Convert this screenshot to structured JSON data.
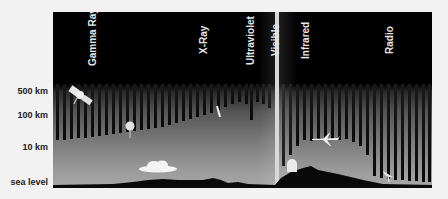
{
  "figure": {
    "bands": [
      {
        "label": "Gamma Ray",
        "x": 93
      },
      {
        "label": "X-Ray",
        "x": 204
      },
      {
        "label": "Ultraviolet",
        "x": 251
      },
      {
        "label": "Visible",
        "x": 276
      },
      {
        "label": "Infrared",
        "x": 306
      },
      {
        "label": "Radio",
        "x": 390
      }
    ],
    "altitudes": [
      {
        "label": "500 km",
        "y": 92
      },
      {
        "label": "100 km",
        "y": 116
      },
      {
        "label": "10 km",
        "y": 148
      },
      {
        "label": "sea level",
        "y": 183
      }
    ],
    "icons": [
      {
        "name": "satellite-icon",
        "x": 72,
        "y": 87
      },
      {
        "name": "rocket-icon",
        "x": 218,
        "y": 106
      },
      {
        "name": "balloon-icon",
        "x": 128,
        "y": 123
      },
      {
        "name": "cloud-icon",
        "x": 139,
        "y": 160
      },
      {
        "name": "airplane-icon",
        "x": 313,
        "y": 135
      },
      {
        "name": "observatory-dome-icon",
        "x": 287,
        "y": 158
      },
      {
        "name": "radio-dish-icon",
        "x": 382,
        "y": 170
      }
    ],
    "colors": {
      "sky_top": "#000000",
      "sky_bottom": "#a8a8a8",
      "ray": "#111111",
      "visible_beam": "#d8d8d8",
      "ground": "#0a0a0a"
    }
  },
  "rays": [
    {
      "x": 57,
      "end": 140
    },
    {
      "x": 64,
      "end": 140
    },
    {
      "x": 71,
      "end": 139
    },
    {
      "x": 78,
      "end": 138
    },
    {
      "x": 85,
      "end": 138
    },
    {
      "x": 92,
      "end": 137
    },
    {
      "x": 99,
      "end": 136
    },
    {
      "x": 106,
      "end": 135
    },
    {
      "x": 113,
      "end": 134
    },
    {
      "x": 120,
      "end": 133
    },
    {
      "x": 127,
      "end": 132
    },
    {
      "x": 134,
      "end": 131
    },
    {
      "x": 141,
      "end": 130
    },
    {
      "x": 148,
      "end": 129
    },
    {
      "x": 155,
      "end": 128
    },
    {
      "x": 162,
      "end": 127
    },
    {
      "x": 169,
      "end": 125
    },
    {
      "x": 176,
      "end": 123
    },
    {
      "x": 183,
      "end": 121
    },
    {
      "x": 190,
      "end": 119
    },
    {
      "x": 197,
      "end": 117
    },
    {
      "x": 204,
      "end": 115
    },
    {
      "x": 211,
      "end": 113
    },
    {
      "x": 218,
      "end": 110
    },
    {
      "x": 225,
      "end": 107
    },
    {
      "x": 232,
      "end": 104
    },
    {
      "x": 239,
      "end": 102
    },
    {
      "x": 246,
      "end": 104
    },
    {
      "x": 251,
      "end": 120
    },
    {
      "x": 257,
      "end": 102
    },
    {
      "x": 263,
      "end": 104
    },
    {
      "x": 269,
      "end": 108
    },
    {
      "x": 283,
      "end": 166
    },
    {
      "x": 290,
      "end": 155
    },
    {
      "x": 297,
      "end": 146
    },
    {
      "x": 304,
      "end": 140
    },
    {
      "x": 311,
      "end": 141
    },
    {
      "x": 318,
      "end": 140
    },
    {
      "x": 325,
      "end": 138
    },
    {
      "x": 332,
      "end": 140
    },
    {
      "x": 339,
      "end": 140
    },
    {
      "x": 346,
      "end": 139
    },
    {
      "x": 353,
      "end": 142
    },
    {
      "x": 360,
      "end": 146
    },
    {
      "x": 367,
      "end": 155
    },
    {
      "x": 374,
      "end": 176
    },
    {
      "x": 381,
      "end": 178
    },
    {
      "x": 388,
      "end": 179
    },
    {
      "x": 395,
      "end": 180
    },
    {
      "x": 402,
      "end": 180
    },
    {
      "x": 409,
      "end": 181
    },
    {
      "x": 416,
      "end": 181
    },
    {
      "x": 423,
      "end": 182
    },
    {
      "x": 429,
      "end": 182
    }
  ]
}
